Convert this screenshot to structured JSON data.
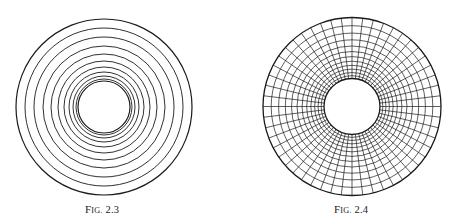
{
  "figures": [
    {
      "id": "fig-2-3",
      "caption_prefix": "F",
      "caption_smallcaps": "IG.",
      "caption_number": "2.3",
      "caption": "Fig. 2.3",
      "description": "Concentric circles, spacing decreasing toward the center",
      "center": [
        104,
        107
      ],
      "radii": [
        88,
        79,
        70,
        61,
        53,
        46,
        40,
        35,
        31,
        28,
        26
      ]
    },
    {
      "id": "fig-2-4",
      "caption_prefix": "F",
      "caption_smallcaps": "IG.",
      "caption_number": "2.4",
      "caption": "Fig. 2.4",
      "description": "Annulus with logarithmic polar grid (concentric circles and radial spokes)",
      "center": [
        352,
        106.5
      ],
      "inner_radius": 28,
      "outer_radius": 89,
      "ring_count": 13,
      "spoke_count": 52
    }
  ],
  "colors": {
    "line": "#1a1a1a",
    "background": "#ffffff"
  }
}
